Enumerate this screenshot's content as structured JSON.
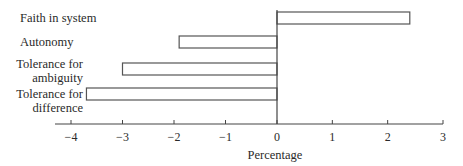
{
  "chart_data": {
    "type": "bar",
    "orientation": "horizontal",
    "title": "",
    "xlabel": "Percentage",
    "ylabel": "",
    "xlim": [
      -4.3,
      3
    ],
    "xticks": [
      -4,
      -3,
      -2,
      -1,
      0,
      1,
      2,
      3
    ],
    "xtick_labels": [
      "−4",
      "−3",
      "−2",
      "−1",
      "0",
      "1",
      "2",
      "3"
    ],
    "grid": false,
    "legend": null,
    "categories": [
      {
        "label_lines": [
          "Faith in system"
        ],
        "value": 2.4
      },
      {
        "label_lines": [
          "Autonomy"
        ],
        "value": -1.9
      },
      {
        "label_lines": [
          "Tolerance for",
          "ambiguity"
        ],
        "value": -3.0
      },
      {
        "label_lines": [
          "Tolerance for",
          "difference"
        ],
        "value": -3.7
      }
    ],
    "bar_fill": "#ffffff",
    "bar_stroke": "#555555"
  }
}
